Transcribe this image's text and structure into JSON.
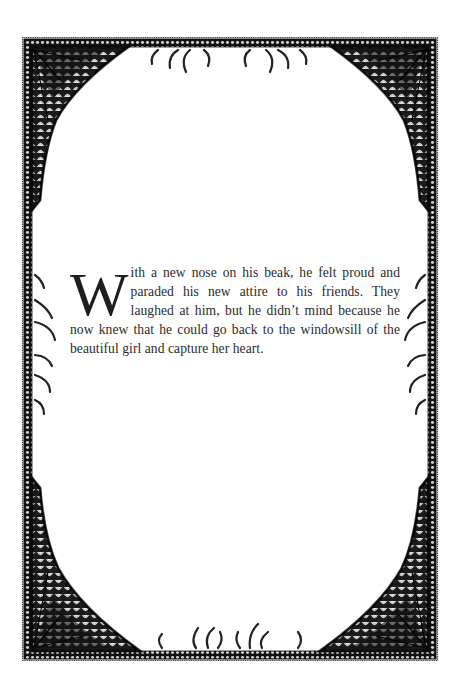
{
  "page": {
    "background": "#ffffff",
    "ink_color": "#1a1a1a",
    "text_color": "#2b2b2b"
  },
  "frame": {
    "style": "ornate engraved border with feathered fan corners and claw ornaments",
    "corners": [
      "fan-corner-top-left",
      "fan-corner-top-right",
      "fan-corner-bottom-left",
      "fan-corner-bottom-right"
    ],
    "ornaments": [
      "claws-top-center",
      "claws-bottom-center",
      "claws-left-middle",
      "claws-right-middle"
    ]
  },
  "story": {
    "drop_cap": "W",
    "text": "ith a new nose on his beak, he felt proud and paraded his new attire to his friends. They laughed at him, but he didn’t mind because he now knew that he could go back to the windowsill of the beautiful girl and capture her heart."
  }
}
